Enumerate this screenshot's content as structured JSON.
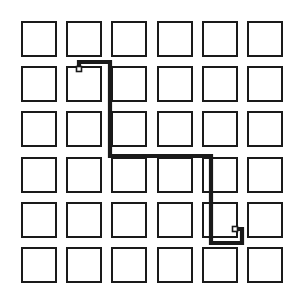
{
  "figure": {
    "width": 307,
    "height": 308,
    "background_color": "#ffffff"
  },
  "grid": {
    "rows": 6,
    "columns": 6,
    "origin_x": 21,
    "origin_y": 21,
    "pitch_x": 45.2,
    "pitch_y": 45.2,
    "square_size": 36,
    "stroke_color": "#1a1a1a",
    "stroke_width": 2.6,
    "fill_color": "#ffffff",
    "cells": [
      {
        "row": 1,
        "col": 1,
        "name": "cell-r1c1"
      },
      {
        "row": 1,
        "col": 2,
        "name": "cell-r1c2"
      },
      {
        "row": 1,
        "col": 3,
        "name": "cell-r1c3"
      },
      {
        "row": 1,
        "col": 4,
        "name": "cell-r1c4"
      },
      {
        "row": 1,
        "col": 5,
        "name": "cell-r1c5"
      },
      {
        "row": 1,
        "col": 6,
        "name": "cell-r1c6"
      },
      {
        "row": 2,
        "col": 1,
        "name": "cell-r2c1"
      },
      {
        "row": 2,
        "col": 2,
        "name": "cell-r2c2"
      },
      {
        "row": 2,
        "col": 3,
        "name": "cell-r2c3"
      },
      {
        "row": 2,
        "col": 4,
        "name": "cell-r2c4"
      },
      {
        "row": 2,
        "col": 5,
        "name": "cell-r2c5"
      },
      {
        "row": 2,
        "col": 6,
        "name": "cell-r2c6"
      },
      {
        "row": 3,
        "col": 1,
        "name": "cell-r3c1"
      },
      {
        "row": 3,
        "col": 2,
        "name": "cell-r3c2"
      },
      {
        "row": 3,
        "col": 3,
        "name": "cell-r3c3"
      },
      {
        "row": 3,
        "col": 4,
        "name": "cell-r3c4"
      },
      {
        "row": 3,
        "col": 5,
        "name": "cell-r3c5"
      },
      {
        "row": 3,
        "col": 6,
        "name": "cell-r3c6"
      },
      {
        "row": 4,
        "col": 1,
        "name": "cell-r4c1"
      },
      {
        "row": 4,
        "col": 2,
        "name": "cell-r4c2"
      },
      {
        "row": 4,
        "col": 3,
        "name": "cell-r4c3"
      },
      {
        "row": 4,
        "col": 4,
        "name": "cell-r4c4"
      },
      {
        "row": 4,
        "col": 5,
        "name": "cell-r4c5"
      },
      {
        "row": 4,
        "col": 6,
        "name": "cell-r4c6"
      },
      {
        "row": 5,
        "col": 1,
        "name": "cell-r5c1"
      },
      {
        "row": 5,
        "col": 2,
        "name": "cell-r5c2"
      },
      {
        "row": 5,
        "col": 3,
        "name": "cell-r5c3"
      },
      {
        "row": 5,
        "col": 4,
        "name": "cell-r5c4"
      },
      {
        "row": 5,
        "col": 5,
        "name": "cell-r5c5"
      },
      {
        "row": 5,
        "col": 6,
        "name": "cell-r5c6"
      },
      {
        "row": 6,
        "col": 1,
        "name": "cell-r6c1"
      },
      {
        "row": 6,
        "col": 2,
        "name": "cell-r6c2"
      },
      {
        "row": 6,
        "col": 3,
        "name": "cell-r6c3"
      },
      {
        "row": 6,
        "col": 4,
        "name": "cell-r6c4"
      },
      {
        "row": 6,
        "col": 5,
        "name": "cell-r6c5"
      },
      {
        "row": 6,
        "col": 6,
        "name": "cell-r6c6"
      }
    ]
  },
  "path": {
    "stroke_color": "#1a1a1a",
    "stroke_width": 4.2,
    "style": "orthogonal",
    "start_cell": "cell-r2c2",
    "end_cell": "cell-r5c5",
    "points": "79,69 79,62 110,62 110,156 211,156 211,243 242,243 242,229 235,229",
    "segments": [
      {
        "name": "segment-start-up",
        "from": [
          79,
          69
        ],
        "to": [
          79,
          62
        ]
      },
      {
        "name": "segment-right-1",
        "from": [
          79,
          62
        ],
        "to": [
          110,
          62
        ]
      },
      {
        "name": "segment-down-1",
        "from": [
          110,
          62
        ],
        "to": [
          110,
          156
        ]
      },
      {
        "name": "segment-right-2",
        "from": [
          110,
          156
        ],
        "to": [
          211,
          156
        ]
      },
      {
        "name": "segment-down-2",
        "from": [
          211,
          156
        ],
        "to": [
          211,
          243
        ]
      },
      {
        "name": "segment-right-3",
        "from": [
          211,
          243
        ],
        "to": [
          242,
          243
        ]
      },
      {
        "name": "segment-up-1",
        "from": [
          242,
          243
        ],
        "to": [
          242,
          229
        ]
      },
      {
        "name": "segment-end-left",
        "from": [
          242,
          229
        ],
        "to": [
          235,
          229
        ]
      }
    ]
  },
  "markers": {
    "start": {
      "label": "start-marker",
      "x": 76.5,
      "y": 66.5,
      "size": 5,
      "stroke_color": "#1a1a1a",
      "fill_color": "#ffffff"
    },
    "end": {
      "label": "end-marker",
      "x": 232.5,
      "y": 226.5,
      "size": 5,
      "stroke_color": "#1a1a1a",
      "fill_color": "#ffffff"
    }
  }
}
